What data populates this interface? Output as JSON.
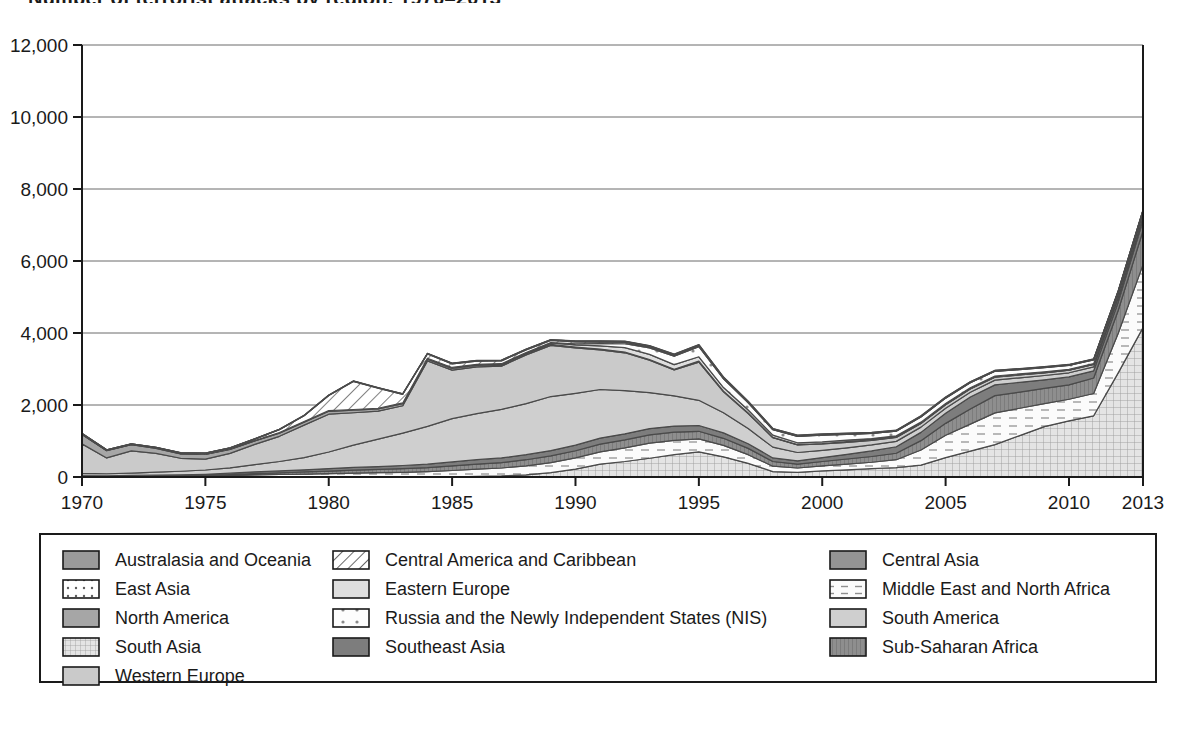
{
  "title": "Number of terrorist attacks by region, 1970–2013",
  "axes": {
    "y_ticks": [
      "0",
      "2,000",
      "4,000",
      "6,000",
      "8,000",
      "10,000",
      "12,000"
    ],
    "x_ticks": [
      "1970",
      "1975",
      "1980",
      "1985",
      "1990",
      "1995",
      "2000",
      "2005",
      "2010",
      "2013"
    ],
    "ylim": [
      0,
      12000
    ],
    "xlim": [
      1970,
      2013
    ]
  },
  "legend": {
    "columns": [
      [
        {
          "label": "Australasia and Oceania",
          "pattern": "solid-mid-gray",
          "color": "#9a9a9a"
        },
        {
          "label": "East Asia",
          "pattern": "dots",
          "color": "#ffffff"
        },
        {
          "label": "North America",
          "pattern": "solid-gray",
          "color": "#a8a8a8"
        },
        {
          "label": "South Asia",
          "pattern": "grid",
          "color": "#dcdcdc"
        },
        {
          "label": "Western Europe",
          "pattern": "solid-light-gray",
          "color": "#c9c9c9"
        }
      ],
      [
        {
          "label": "Central America and Caribbean",
          "pattern": "diagonal-hatch",
          "color": "#ffffff"
        },
        {
          "label": "Eastern Europe",
          "pattern": "solid-pale",
          "color": "#d8d8d8"
        },
        {
          "label": "Russia and the Newly Independent States (NIS)",
          "pattern": "sparse-dots",
          "color": "#ffffff"
        },
        {
          "label": "Southeast Asia",
          "pattern": "solid-dark-gray",
          "color": "#7d7d7d"
        }
      ],
      [
        {
          "label": "Central Asia",
          "pattern": "solid-mid-gray-2",
          "color": "#949494"
        },
        {
          "label": "Middle East and North Africa",
          "pattern": "dashes",
          "color": "#ffffff"
        },
        {
          "label": "South America",
          "pattern": "solid-light-gray-2",
          "color": "#cccccc"
        },
        {
          "label": "Sub-Saharan Africa",
          "pattern": "vertical-lines",
          "color": "#8c8c8c"
        }
      ]
    ]
  },
  "chart_data": {
    "type": "area",
    "stacked": true,
    "title": "Number of terrorist attacks by region, 1970–2013",
    "xlabel": "",
    "ylabel": "",
    "ylim": [
      0,
      12000
    ],
    "grid": true,
    "legend_position": "bottom",
    "x": [
      1970,
      1971,
      1972,
      1973,
      1974,
      1975,
      1976,
      1977,
      1978,
      1979,
      1980,
      1981,
      1982,
      1983,
      1984,
      1985,
      1986,
      1987,
      1988,
      1989,
      1990,
      1991,
      1992,
      1993,
      1994,
      1995,
      1996,
      1997,
      1998,
      1999,
      2000,
      2001,
      2002,
      2003,
      2004,
      2005,
      2006,
      2007,
      2008,
      2009,
      2010,
      2011,
      2012,
      2013
    ],
    "series": [
      {
        "name": "South Asia",
        "pattern": "grid",
        "values": [
          0,
          0,
          0,
          0,
          0,
          0,
          0,
          0,
          0,
          0,
          0,
          0,
          0,
          0,
          0,
          0,
          20,
          30,
          60,
          120,
          220,
          360,
          430,
          520,
          620,
          700,
          560,
          380,
          150,
          130,
          170,
          200,
          230,
          260,
          330,
          540,
          720,
          900,
          1150,
          1400,
          1560,
          1700,
          2900,
          4150
        ]
      },
      {
        "name": "Middle East and North Africa",
        "pattern": "dashes",
        "values": [
          10,
          10,
          15,
          15,
          20,
          25,
          40,
          60,
          70,
          80,
          95,
          110,
          120,
          130,
          150,
          180,
          200,
          220,
          250,
          280,
          310,
          340,
          380,
          420,
          400,
          360,
          320,
          240,
          150,
          120,
          140,
          160,
          180,
          220,
          420,
          620,
          750,
          880,
          760,
          640,
          600,
          620,
          1100,
          1750
        ]
      },
      {
        "name": "Sub-Saharan Africa",
        "pattern": "vertical-lines",
        "values": [
          5,
          5,
          5,
          10,
          10,
          15,
          25,
          35,
          45,
          60,
          70,
          80,
          90,
          100,
          110,
          130,
          140,
          150,
          170,
          185,
          200,
          215,
          220,
          230,
          225,
          210,
          195,
          175,
          130,
          110,
          120,
          140,
          160,
          180,
          260,
          330,
          420,
          480,
          450,
          420,
          400,
          430,
          640,
          940
        ]
      },
      {
        "name": "Southeast Asia",
        "pattern": "solid-dark-gray",
        "values": [
          25,
          20,
          25,
          30,
          30,
          35,
          40,
          50,
          55,
          60,
          70,
          75,
          80,
          90,
          95,
          110,
          120,
          130,
          140,
          150,
          155,
          165,
          170,
          175,
          170,
          160,
          150,
          130,
          100,
          90,
          110,
          130,
          155,
          180,
          230,
          280,
          330,
          300,
          270,
          240,
          220,
          200,
          230,
          280
        ]
      },
      {
        "name": "South America",
        "pattern": "solid-light-gray-2",
        "values": [
          60,
          55,
          60,
          80,
          100,
          120,
          150,
          200,
          260,
          340,
          460,
          620,
          760,
          900,
          1050,
          1200,
          1280,
          1350,
          1420,
          1500,
          1440,
          1350,
          1200,
          1000,
          840,
          700,
          560,
          420,
          300,
          230,
          200,
          180,
          165,
          150,
          145,
          140,
          135,
          130,
          125,
          120,
          115,
          110,
          105,
          100
        ]
      },
      {
        "name": "Western Europe",
        "pattern": "solid-light-gray",
        "values": [
          820,
          440,
          620,
          520,
          360,
          300,
          400,
          560,
          700,
          900,
          1050,
          900,
          780,
          760,
          1820,
          1350,
          1300,
          1200,
          1350,
          1420,
          1260,
          1100,
          1050,
          900,
          720,
          1060,
          580,
          420,
          260,
          210,
          180,
          150,
          130,
          110,
          100,
          95,
          90,
          85,
          80,
          75,
          70,
          65,
          60,
          55
        ]
      },
      {
        "name": "North America",
        "pattern": "solid-gray",
        "values": [
          260,
          200,
          170,
          140,
          120,
          130,
          110,
          95,
          90,
          85,
          80,
          70,
          60,
          55,
          50,
          45,
          40,
          35,
          30,
          28,
          26,
          24,
          22,
          20,
          18,
          30,
          20,
          15,
          12,
          10,
          9,
          25,
          10,
          8,
          7,
          6,
          6,
          5,
          5,
          5,
          5,
          5,
          5,
          5
        ]
      },
      {
        "name": "Eastern Europe",
        "pattern": "solid-pale",
        "values": [
          10,
          8,
          8,
          10,
          10,
          10,
          12,
          12,
          15,
          15,
          18,
          20,
          20,
          22,
          25,
          28,
          30,
          32,
          35,
          40,
          60,
          90,
          120,
          140,
          130,
          120,
          100,
          80,
          60,
          50,
          45,
          40,
          38,
          35,
          32,
          30,
          28,
          26,
          25,
          24,
          22,
          20,
          20,
          20
        ]
      },
      {
        "name": "Russia and the Newly Independent States (NIS)",
        "pattern": "sparse-dots",
        "values": [
          0,
          0,
          0,
          0,
          0,
          0,
          0,
          0,
          0,
          0,
          0,
          0,
          0,
          0,
          0,
          0,
          0,
          0,
          5,
          10,
          30,
          60,
          110,
          180,
          230,
          280,
          240,
          200,
          150,
          180,
          190,
          160,
          140,
          130,
          145,
          150,
          140,
          130,
          120,
          115,
          110,
          105,
          100,
          95
        ]
      },
      {
        "name": "Central America and Caribbean",
        "pattern": "diagonal-hatch",
        "values": [
          15,
          12,
          12,
          15,
          18,
          20,
          25,
          40,
          80,
          160,
          420,
          780,
          560,
          240,
          120,
          100,
          90,
          80,
          70,
          60,
          55,
          45,
          35,
          25,
          20,
          15,
          12,
          10,
          8,
          6,
          5,
          5,
          4,
          4,
          4,
          3,
          3,
          3,
          3,
          3,
          3,
          3,
          3,
          3
        ]
      },
      {
        "name": "East Asia",
        "pattern": "dots",
        "values": [
          5,
          4,
          4,
          5,
          5,
          6,
          6,
          7,
          8,
          8,
          9,
          10,
          10,
          12,
          12,
          14,
          15,
          16,
          18,
          20,
          20,
          22,
          22,
          24,
          22,
          20,
          18,
          16,
          12,
          10,
          10,
          10,
          9,
          9,
          10,
          10,
          10,
          10,
          9,
          9,
          8,
          8,
          8,
          8
        ]
      },
      {
        "name": "Central Asia",
        "pattern": "solid-mid-gray-2",
        "values": [
          0,
          0,
          0,
          0,
          0,
          0,
          0,
          0,
          0,
          0,
          0,
          0,
          0,
          0,
          0,
          0,
          0,
          0,
          0,
          0,
          2,
          4,
          8,
          12,
          16,
          20,
          18,
          15,
          12,
          14,
          16,
          14,
          12,
          11,
          12,
          13,
          12,
          11,
          10,
          10,
          9,
          9,
          9,
          9
        ]
      },
      {
        "name": "Australasia and Oceania",
        "pattern": "solid-mid-gray",
        "values": [
          2,
          2,
          2,
          2,
          2,
          3,
          3,
          3,
          3,
          4,
          4,
          4,
          4,
          4,
          5,
          5,
          5,
          5,
          5,
          5,
          5,
          5,
          5,
          5,
          5,
          5,
          4,
          4,
          4,
          4,
          4,
          4,
          4,
          4,
          4,
          4,
          4,
          4,
          4,
          4,
          4,
          4,
          4,
          4
        ]
      }
    ]
  }
}
